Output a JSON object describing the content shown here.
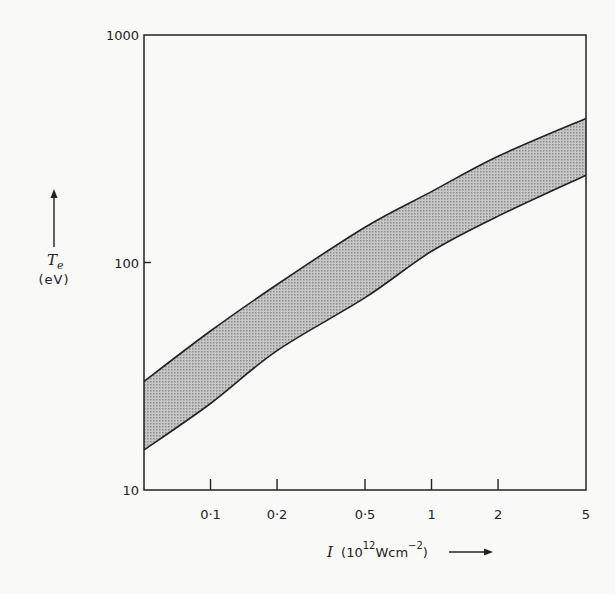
{
  "chart_data": {
    "type": "area",
    "title": "",
    "xlabel": "I (10^12 W cm^-2)",
    "ylabel": "T_e (eV)",
    "xscale": "log",
    "yscale": "log",
    "xlim": [
      0.05,
      5
    ],
    "ylim": [
      10,
      1000
    ],
    "grid": false,
    "legend": null,
    "x_ticks": [
      {
        "value": 0.1,
        "label": "0·1"
      },
      {
        "value": 0.2,
        "label": "0·2"
      },
      {
        "value": 0.5,
        "label": "0·5"
      },
      {
        "value": 1,
        "label": "1"
      },
      {
        "value": 2,
        "label": "2"
      },
      {
        "value": 5,
        "label": "5"
      }
    ],
    "y_ticks": [
      {
        "value": 10,
        "label": "10"
      },
      {
        "value": 100,
        "label": "100"
      },
      {
        "value": 1000,
        "label": "1000"
      }
    ],
    "x": [
      0.05,
      0.1,
      0.2,
      0.5,
      1,
      2,
      5
    ],
    "series": [
      {
        "name": "upper bound",
        "values": [
          30,
          50,
          80,
          143,
          205,
          293,
          430
        ]
      },
      {
        "name": "lower bound",
        "values": [
          15,
          24,
          41,
          70,
          112,
          160,
          242
        ]
      }
    ],
    "fill": "shaded band between upper and lower bounds"
  },
  "labels": {
    "y_symbol": "T",
    "y_subscript": "e",
    "y_unit": "(eV)",
    "x_symbol": "I",
    "x_unit_open": "(10",
    "x_unit_exp": "12",
    "x_unit_mid": "Wcm",
    "x_unit_exp2": "−2",
    "x_unit_close": ")"
  }
}
